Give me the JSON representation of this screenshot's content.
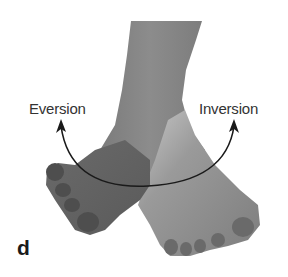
{
  "figure": {
    "panel_letter": "d",
    "labels": {
      "left": "Eversion",
      "right": "Inversion"
    },
    "arrow": {
      "type": "double-headed curved arrow",
      "color": "#1a1a1a"
    },
    "colors": {
      "background": "#ffffff",
      "skin_dark": "#6e6e6e",
      "skin_mid": "#8a8a8a",
      "skin_light": "#bdbdbd",
      "text": "#333333"
    }
  }
}
